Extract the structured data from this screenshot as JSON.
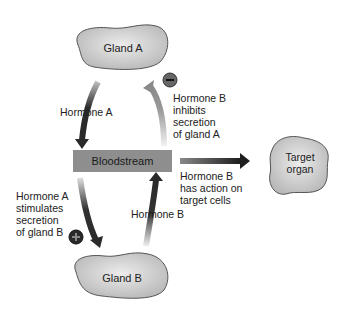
{
  "diagram": {
    "nodes": {
      "gland_a": {
        "label": "Gland A"
      },
      "gland_b": {
        "label": "Gland B"
      },
      "bloodstream": {
        "label": "Bloodstream"
      },
      "target": {
        "line1": "Target",
        "line2": "organ"
      }
    },
    "labels": {
      "hormone_a": "Hormone A",
      "hormone_b": "Hormone B",
      "inhibits": [
        "Hormone B",
        "inhibits",
        "secretion",
        "of gland A"
      ],
      "stimulates": [
        "Hormone A",
        "stimulates",
        "secretion",
        "of gland B"
      ],
      "action": [
        "Hormone B",
        "has action on",
        "target cells"
      ]
    },
    "signs": {
      "minus": "−",
      "plus": "+"
    },
    "colors": {
      "gland_fill": "#d4d4d4",
      "bloodstream_fill": "#8e8e8e",
      "arrow_dark": "#2a2a2a",
      "arrow_light": "#8a8a8a"
    }
  }
}
